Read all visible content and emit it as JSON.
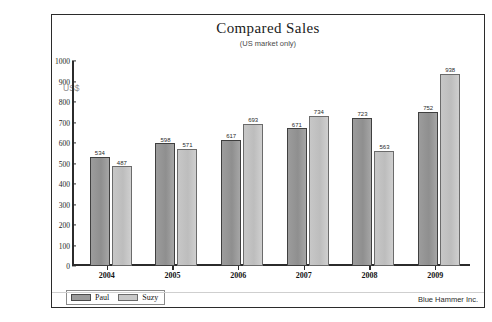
{
  "page": {
    "cutoff_top_text": "",
    "footer_note": "Blue Hammer Inc."
  },
  "chart": {
    "title": "Compared Sales",
    "subtitle": "(US market only)",
    "y_unit_label": "US$",
    "legend": [
      {
        "label": "Paul",
        "color": "#9a9a9a"
      },
      {
        "label": "Suzy",
        "color": "#c8c8c8"
      }
    ]
  },
  "chart_data": {
    "type": "bar",
    "title": "Compared Sales",
    "subtitle": "(US market only)",
    "xlabel": "",
    "ylabel": "US$",
    "ylim": [
      0,
      1000
    ],
    "yticks": [
      0,
      100,
      200,
      300,
      400,
      500,
      600,
      700,
      800,
      900,
      1000
    ],
    "grid": false,
    "legend_position": "bottom-left",
    "categories": [
      "2004",
      "2005",
      "2006",
      "2007",
      "2008",
      "2009"
    ],
    "series": [
      {
        "name": "Paul",
        "color": "#9a9a9a",
        "values": [
          534,
          598,
          617,
          671,
          723,
          752
        ],
        "labels": [
          "534",
          "598",
          "617",
          "671",
          "723",
          "752"
        ]
      },
      {
        "name": "Suzy",
        "color": "#c8c8c8",
        "values": [
          487,
          571,
          693,
          734,
          563,
          938
        ],
        "labels": [
          "487",
          "571",
          "693",
          "734",
          "563",
          "938"
        ]
      }
    ]
  }
}
